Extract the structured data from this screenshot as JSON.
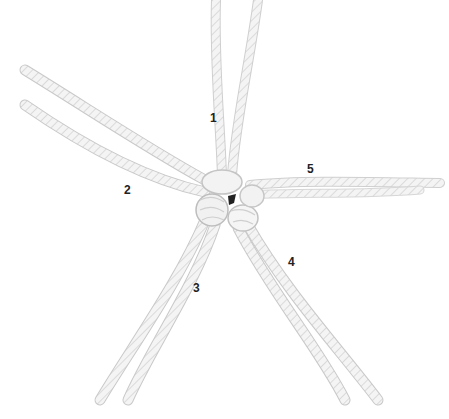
{
  "image": {
    "subject": "crown knot in white rope with five strands",
    "background_color": "#ffffff",
    "rope_color": "#f2f2f2",
    "rope_shadow_color": "#c8c8c8"
  },
  "labels": [
    {
      "text": "1",
      "x": 210,
      "y": 112
    },
    {
      "text": "2",
      "x": 124,
      "y": 184
    },
    {
      "text": "3",
      "x": 193,
      "y": 282
    },
    {
      "text": "4",
      "x": 288,
      "y": 256
    },
    {
      "text": "5",
      "x": 307,
      "y": 163
    }
  ]
}
